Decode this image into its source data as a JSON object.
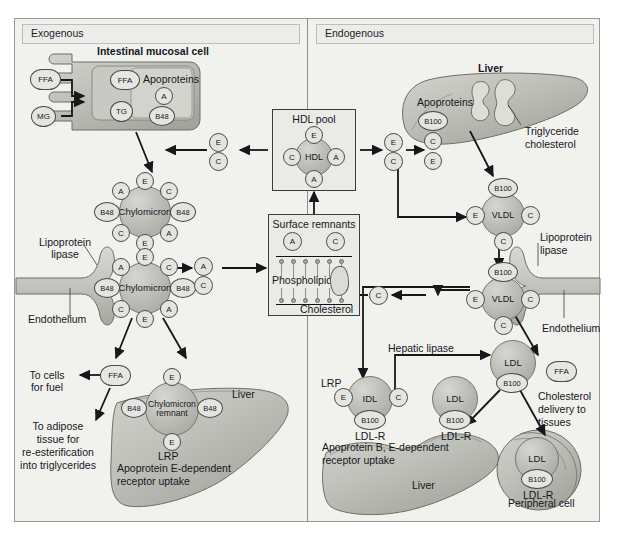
{
  "figure": {
    "panels": [
      {
        "id": "exogenous",
        "banner": "Exogenous"
      },
      {
        "id": "endogenous",
        "banner": "Endogenous"
      }
    ]
  },
  "exogenous": {
    "intestinal_cell": {
      "title": "Intestinal mucosal cell",
      "inputs": [
        {
          "label": "FFA",
          "name": "ffa-input"
        },
        {
          "label": "MG",
          "name": "mg-input"
        }
      ],
      "contents": [
        {
          "label": "FFA"
        },
        {
          "label": "TG"
        }
      ],
      "apoproteins_title": "Apoproteins",
      "apoproteins": [
        "A",
        "B48"
      ]
    },
    "chylomicron_upper": {
      "core": "Chylomicron",
      "apos": [
        "E",
        "C",
        "B48",
        "A",
        "E",
        "C",
        "B48",
        "A"
      ]
    },
    "chylomicron_lower": {
      "core": "Chylomicron",
      "apos": [
        "E",
        "C",
        "B48",
        "A",
        "E",
        "C",
        "B48",
        "A"
      ]
    },
    "lipoprotein_lipase_label": "Lipoprotein\nlipase",
    "endothelium_label": "Endothelium",
    "ffa_release": "FFA",
    "to_cells_label": "To cells\nfor fuel",
    "to_adipose_label": "To adipose\ntissue for\nre-esterification\ninto triglycerides",
    "transfer_to_surface": [
      "A",
      "C"
    ],
    "remnant": {
      "core": "Chylomicron\nremnant",
      "apos": [
        "E",
        "B48",
        "B48",
        "E"
      ],
      "receptor": "LRP",
      "caption": "Apoprotein E-dependent\nreceptor uptake",
      "organ": "Liver"
    }
  },
  "center": {
    "hdl_pool": {
      "title": "HDL pool",
      "core": "HDL",
      "apos": [
        "E",
        "C",
        "A",
        "A"
      ]
    },
    "hdl_transfer_left": [
      "E",
      "C"
    ],
    "hdl_transfer_right": [
      "E",
      "C"
    ],
    "surface_remnants": {
      "title": "Surface remnants",
      "apos": [
        "A",
        "C"
      ],
      "layer_label": "Phospholipids",
      "bottom_label": "Cholesterol"
    },
    "c_from_vldl": "C"
  },
  "endogenous": {
    "liver_top": {
      "organ": "Liver",
      "apoproteins_title": "Apoproteins",
      "apoproteins": [
        "B100",
        "C",
        "E"
      ],
      "droplet_label": "Triglyceride\ncholesterol"
    },
    "vldl_upper": {
      "core": "VLDL",
      "apos": [
        "B100",
        "E",
        "C",
        "C"
      ]
    },
    "vldl_lower": {
      "core": "VLDL",
      "apos": [
        "B100",
        "E",
        "C",
        "C"
      ]
    },
    "lipoprotein_lipase_label": "Lipoprotein\nlipase",
    "endothelium_label": "Endothelium",
    "ffa_release": "FFA",
    "cholesterol_delivery_label": "Cholesterol\ndelivery to\ntissues",
    "hepatic_lipase_label": "Hepatic lipase",
    "ldl_free": {
      "core": "LDL",
      "apo": "B100"
    },
    "idl_bound": {
      "core": "IDL",
      "apos": [
        "E",
        "C",
        "B100"
      ],
      "receptor_left": "LRP",
      "receptor": "LDL-R"
    },
    "ldl_bound": {
      "core": "LDL",
      "apo": "B100",
      "receptor": "LDL-R"
    },
    "liver_caption": "Apoprotein B, E-dependent\nreceptor uptake",
    "liver_bottom_label": "Liver",
    "peripheral": {
      "core": "LDL",
      "apo": "B100",
      "receptor": "LDL-R",
      "label": "Peripheral cell"
    }
  },
  "colors": {
    "page_bg": "#ffffff",
    "panel_bg": "#f1f1ee",
    "banner_bg": "#ececea",
    "organ_fill": "#b9b9b3",
    "sphere_fill": "#bdbdb8",
    "stroke": "#16181b",
    "text": "#15181c"
  }
}
